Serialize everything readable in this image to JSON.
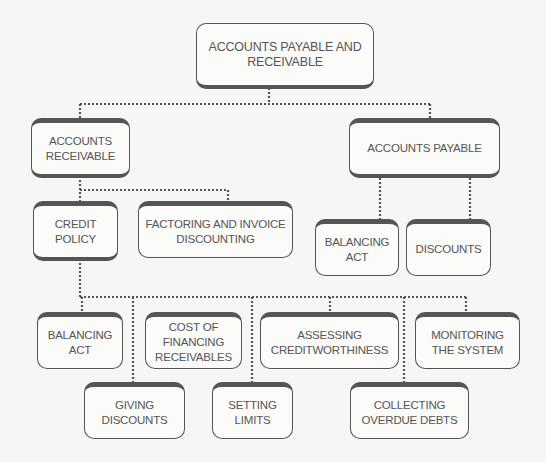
{
  "diagram": {
    "type": "hierarchy",
    "root": {
      "label": "ACCOUNTS PAYABLE AND RECEIVABLE"
    },
    "nodes": {
      "accounts_receivable": "ACCOUNTS RECEIVABLE",
      "accounts_payable": "ACCOUNTS PAYABLE",
      "credit_policy": "CREDIT POLICY",
      "factoring": "FACTORING AND INVOICE DISCOUNTING",
      "ap_balancing_act": "BALANCING ACT",
      "ap_discounts": "DISCOUNTS",
      "cp_balancing_act": "BALANCING ACT",
      "cost_of_financing": "COST OF FINANCING RECEIVABLES",
      "assessing_creditworthiness": "ASSESSING CREDITWORTHINESS",
      "monitoring": "MONITORING THE SYSTEM",
      "giving_discounts": "GIVING DISCOUNTS",
      "setting_limits": "SETTING LIMITS",
      "collecting_debts": "COLLECTING OVERDUE DEBTS"
    },
    "edges": [
      [
        "root",
        "accounts_receivable"
      ],
      [
        "root",
        "accounts_payable"
      ],
      [
        "accounts_receivable",
        "credit_policy"
      ],
      [
        "accounts_receivable",
        "factoring"
      ],
      [
        "accounts_payable",
        "ap_balancing_act"
      ],
      [
        "accounts_payable",
        "ap_discounts"
      ],
      [
        "credit_policy",
        "cp_balancing_act"
      ],
      [
        "credit_policy",
        "giving_discounts"
      ],
      [
        "credit_policy",
        "cost_of_financing"
      ],
      [
        "credit_policy",
        "setting_limits"
      ],
      [
        "credit_policy",
        "assessing_creditworthiness"
      ],
      [
        "credit_policy",
        "collecting_debts"
      ],
      [
        "credit_policy",
        "monitoring"
      ]
    ],
    "colors": {
      "line": "#555555",
      "box_fill": "#fbfbfa",
      "background": "#f6f6f4"
    }
  }
}
